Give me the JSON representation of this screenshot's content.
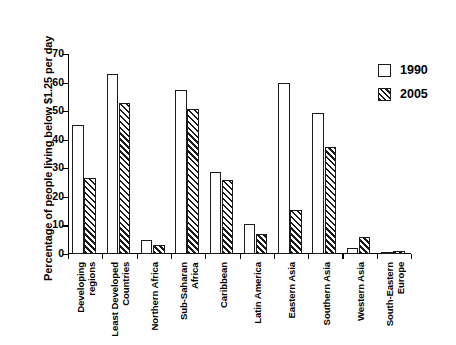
{
  "chart_data": {
    "type": "bar",
    "title": "",
    "xlabel": "",
    "ylabel": "Percentage of people living below $1.25 per day",
    "ylim": [
      0,
      70
    ],
    "ytick_labels": [
      "0",
      "10",
      "20",
      "30",
      "40",
      "50",
      "60",
      "70"
    ],
    "ytick_values": [
      0,
      10,
      20,
      30,
      40,
      50,
      60,
      70
    ],
    "grid": false,
    "legend_position": "top-right",
    "categories": [
      "Developing\nregions",
      "Least Developed\nCountries",
      "Northern Africa",
      "Sub-Saharan\nAfrica",
      "Caribbean",
      "Latin America",
      "Eastern Asia",
      "Southern Asia",
      "Western Asia",
      "South-Eastern\nEurope"
    ],
    "series": [
      {
        "name": "1990",
        "values": [
          45.3,
          63.0,
          5.0,
          57.3,
          28.7,
          10.5,
          60.0,
          49.3,
          2.0,
          0.5
        ]
      },
      {
        "name": "2005",
        "values": [
          26.5,
          53.0,
          3.0,
          50.6,
          25.8,
          7.0,
          15.5,
          37.5,
          6.0,
          1.0
        ]
      }
    ]
  },
  "legend": {
    "entries": [
      {
        "label": "1990",
        "swatch": "hollow"
      },
      {
        "label": "2005",
        "swatch": "hatched"
      }
    ]
  },
  "colors": {
    "axis": "#1a1a1a",
    "bar_1990_fill": "#ffffff",
    "bar_2005_fill": "#ffffff",
    "hatch": "#1a1a1a",
    "background": "#ffffff"
  }
}
